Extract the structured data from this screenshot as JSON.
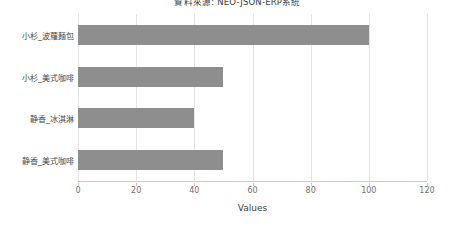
{
  "chart_data": {
    "type": "bar",
    "orientation": "horizontal",
    "title": "資料來源: NEO-JSON-ERP系統",
    "xlabel": "Values",
    "ylabel": "",
    "categories": [
      "小杉_波蘿麵包",
      "小杉_美式咖啡",
      "静香_冰淇淋",
      "静香_美式咖啡"
    ],
    "values": [
      100,
      50,
      40,
      50
    ],
    "xlim": [
      0,
      120
    ],
    "xticks": [
      0,
      20,
      40,
      60,
      80,
      100,
      120
    ],
    "xticklabels": [
      "0",
      "20",
      "40",
      "60",
      "80",
      "100",
      "120"
    ],
    "grid": "vertical",
    "legend": false,
    "bar_color": "#8e8e8e",
    "background_color": "#ffffff",
    "gridline_color": "#e4e4e4",
    "axis_color": "#c9c9c9"
  }
}
